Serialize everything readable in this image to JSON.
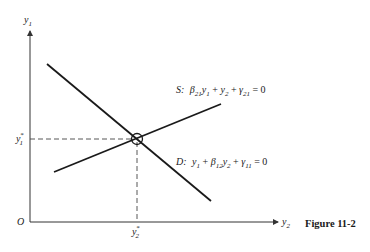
{
  "figure": {
    "caption": "Figure 11-2",
    "origin_label": "O",
    "y_axis": {
      "label": "y",
      "sub": "1"
    },
    "x_axis": {
      "label": "y",
      "sub": "2"
    },
    "equilibrium": {
      "y1_label": "y",
      "y1_sub": "1",
      "y1_sup": "*",
      "y2_label": "y",
      "y2_sub": "2",
      "y2_sup": "*"
    },
    "supply_curve": {
      "name": "S:",
      "parts": [
        "β",
        "21",
        "y",
        "1",
        " + ",
        "y",
        "2",
        " + ",
        "γ",
        "21",
        " = 0"
      ]
    },
    "demand_curve": {
      "name": "D:",
      "parts": [
        "y",
        "1",
        " + ",
        "β",
        "12",
        "y",
        "2",
        " + ",
        "γ",
        "11",
        " = 0"
      ]
    },
    "colors": {
      "ink": "#1a1a1a",
      "axis": "#333333",
      "background": "#ffffff"
    }
  }
}
